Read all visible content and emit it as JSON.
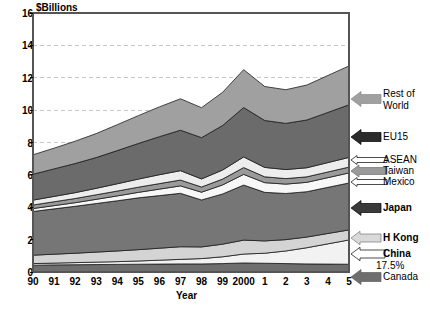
{
  "chart_data": {
    "type": "area",
    "stacked": true,
    "title": "",
    "ylabel": "$Billions",
    "xlabel": "Year",
    "ylim": [
      0,
      16
    ],
    "yticks": [
      0,
      2,
      4,
      6,
      8,
      10,
      12,
      14,
      16
    ],
    "grid": true,
    "grid_style": "dashed-horizontal",
    "legend_position": "right-annotations",
    "categories": [
      "90",
      "91",
      "92",
      "93",
      "94",
      "95",
      "96",
      "97",
      "98",
      "99",
      "2000",
      "1",
      "2",
      "3",
      "4",
      "5"
    ],
    "x_full_years": [
      1990,
      1991,
      1992,
      1993,
      1994,
      1995,
      1996,
      1997,
      1998,
      1999,
      2000,
      2001,
      2002,
      2003,
      2004,
      2005
    ],
    "annotations": [
      {
        "text": "17.5%",
        "series": "Canada",
        "x": "5"
      }
    ],
    "series": [
      {
        "name": "Canada",
        "color": "#6e6e6e",
        "values": [
          0.42,
          0.44,
          0.45,
          0.46,
          0.47,
          0.48,
          0.49,
          0.5,
          0.5,
          0.52,
          0.56,
          0.54,
          0.52,
          0.5,
          0.49,
          0.48
        ]
      },
      {
        "name": "China",
        "color": "#f2f2f2",
        "values": [
          0.1,
          0.11,
          0.13,
          0.15,
          0.17,
          0.2,
          0.24,
          0.28,
          0.33,
          0.42,
          0.55,
          0.62,
          0.78,
          1.0,
          1.25,
          1.5
        ]
      },
      {
        "name": "H Kong",
        "color": "#d4d4d4",
        "values": [
          0.52,
          0.55,
          0.58,
          0.62,
          0.66,
          0.7,
          0.74,
          0.78,
          0.72,
          0.78,
          0.86,
          0.76,
          0.7,
          0.66,
          0.64,
          0.62
        ]
      },
      {
        "name": "Japan",
        "color": "#767676",
        "values": [
          2.7,
          2.8,
          2.9,
          3.0,
          3.1,
          3.2,
          3.25,
          3.3,
          2.9,
          3.1,
          3.4,
          3.0,
          2.85,
          2.8,
          2.85,
          2.9
        ]
      },
      {
        "name": "Mexico",
        "color": "#f7f7f7",
        "values": [
          0.18,
          0.2,
          0.22,
          0.26,
          0.3,
          0.34,
          0.4,
          0.46,
          0.48,
          0.56,
          0.66,
          0.6,
          0.58,
          0.58,
          0.6,
          0.62
        ]
      },
      {
        "name": "Taiwan",
        "color": "#9a9a9a",
        "values": [
          0.22,
          0.24,
          0.26,
          0.28,
          0.3,
          0.32,
          0.34,
          0.36,
          0.32,
          0.36,
          0.42,
          0.36,
          0.34,
          0.34,
          0.35,
          0.36
        ]
      },
      {
        "name": "ASEAN",
        "color": "#ededed",
        "values": [
          0.3,
          0.33,
          0.36,
          0.4,
          0.45,
          0.5,
          0.55,
          0.58,
          0.5,
          0.56,
          0.66,
          0.58,
          0.56,
          0.56,
          0.58,
          0.6
        ]
      },
      {
        "name": "EU15",
        "color": "#6b6b6b",
        "values": [
          1.6,
          1.7,
          1.8,
          1.9,
          2.05,
          2.2,
          2.35,
          2.5,
          2.55,
          2.75,
          3.05,
          2.9,
          2.85,
          2.95,
          3.1,
          3.25
        ]
      },
      {
        "name": "Rest of World",
        "color": "#a0a0a0",
        "values": [
          1.2,
          1.28,
          1.38,
          1.48,
          1.6,
          1.72,
          1.84,
          1.94,
          1.85,
          2.05,
          2.34,
          2.1,
          2.08,
          2.16,
          2.28,
          2.4
        ]
      }
    ],
    "totals": [
      7.24,
      7.65,
      8.08,
      8.55,
      9.1,
      9.66,
      10.2,
      10.7,
      10.15,
      11.1,
      14.5,
      11.46,
      11.26,
      11.55,
      12.14,
      12.73
    ]
  },
  "legend": {
    "items": [
      {
        "label": "Rest of",
        "label2": "World",
        "bold": false,
        "arrow_color": "#a0a0a0"
      },
      {
        "label": "EU15",
        "bold": false,
        "arrow_color": "#2b2b2b"
      },
      {
        "label": "ASEAN",
        "bold": false,
        "arrow_color": "#ffffff"
      },
      {
        "label": "Taiwan",
        "bold": false,
        "arrow_color": "#9a9a9a"
      },
      {
        "label": "Mexico",
        "bold": false,
        "arrow_color": "#ffffff"
      },
      {
        "label": "Japan",
        "bold": true,
        "arrow_color": "#3a3a3a"
      },
      {
        "label": "H Kong",
        "bold": true,
        "arrow_color": "#d9d9d9"
      },
      {
        "label": "China",
        "bold": true,
        "arrow_color": "#ffffff"
      },
      {
        "label": "17.5%",
        "bold": false,
        "arrow_color": null
      },
      {
        "label": "Canada",
        "bold": false,
        "arrow_color": "#6e6e6e"
      }
    ]
  },
  "colors": {
    "plot_border": "#555555",
    "gridline": "#c8c8c8",
    "background": "#ffffff",
    "text": "#000000"
  }
}
